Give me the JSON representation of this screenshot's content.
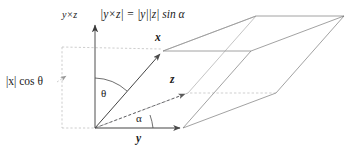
{
  "figure": {
    "background_color": "#ffffff",
    "line_color": "#4d4d4d",
    "solid_line_color": "#555555",
    "dashed_line_color": "#9a9a9a",
    "text_color": "#1a1a1a",
    "width": 360,
    "height": 151
  },
  "labels": {
    "cross_axis": "y×z",
    "formula": "|y×z| = |y||z| sin α",
    "formula_parts": {
      "lhs_open": "|",
      "lhs_y": "y",
      "lhs_cross": "×",
      "lhs_z": "z",
      "lhs_close": "|",
      "equals": "=",
      "rhs_y": "|y|",
      "rhs_z": "|z|",
      "rhs_func": "sin",
      "rhs_angle": "α"
    },
    "projection": "|x| cos θ",
    "projection_parts": {
      "open": "|",
      "var": "x",
      "close": "|",
      "func": "cos",
      "angle": "θ"
    },
    "vector_x": "x",
    "vector_y": "y",
    "vector_z": "z",
    "angle_theta": "θ",
    "angle_alpha": "α"
  },
  "geometry": {
    "origin": {
      "x": 95,
      "y": 128
    },
    "vector_x_tip": {
      "x": 163,
      "y": 51
    },
    "vector_y_tip": {
      "x": 183,
      "y": 128
    },
    "vector_z_tip": {
      "x": 188,
      "y": 93
    },
    "cross_axis_tip": {
      "x": 95,
      "y": 22
    },
    "theta_degrees": 41,
    "alpha_degrees": 28
  }
}
